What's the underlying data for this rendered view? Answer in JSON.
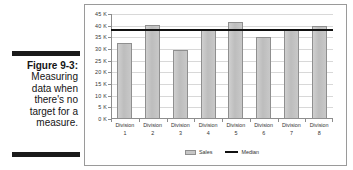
{
  "caption": {
    "figure_number": "Figure 9-3:",
    "lines": [
      "Measuring",
      "data when",
      "there's no",
      "target for a",
      "measure."
    ]
  },
  "chart_data": {
    "type": "bar",
    "title": "",
    "xlabel": "",
    "ylabel": "",
    "ylim": [
      0,
      45000
    ],
    "grid": true,
    "legend_position": "bottom",
    "categories": [
      "Division 1",
      "Division 2",
      "Division 3",
      "Division 4",
      "Division 5",
      "Division 6",
      "Division 7",
      "Division 8"
    ],
    "category_lines": [
      [
        "Division",
        "1"
      ],
      [
        "Division",
        "2"
      ],
      [
        "Division",
        "3"
      ],
      [
        "Division",
        "4"
      ],
      [
        "Division",
        "5"
      ],
      [
        "Division",
        "6"
      ],
      [
        "Division",
        "7"
      ],
      [
        "Division",
        "8"
      ]
    ],
    "series": [
      {
        "name": "Sales",
        "type": "bar",
        "color": "#c2c2c2",
        "values": [
          32500,
          40100,
          29500,
          38000,
          41500,
          35000,
          38000,
          40000
        ]
      },
      {
        "name": "Median",
        "type": "line",
        "color": "#111111",
        "value": 38000,
        "values": [
          38000,
          38000,
          38000,
          38000,
          38000,
          38000,
          38000,
          38000
        ]
      }
    ],
    "ytick_values": [
      45000,
      40000,
      35000,
      30000,
      25000,
      20000,
      15000,
      10000,
      5000,
      0
    ],
    "ytick_labels": [
      "45 K",
      "40 K",
      "35 K",
      "30 K",
      "25 K",
      "20 K",
      "15 K",
      "10 K",
      "5 K",
      "0 K"
    ],
    "legend": [
      {
        "label": "Sales",
        "marker": "bar-swatch"
      },
      {
        "label": "Median",
        "marker": "line-swatch"
      }
    ]
  },
  "colors": {
    "bar_fill": "#c2c2c2",
    "bar_stroke": "#8f8f8f",
    "median_line": "#111111",
    "grid": "#d8d8d8",
    "axis": "#8d8d8d",
    "frame": "#9a9a9a",
    "caption_rule": "#1a1a1a"
  }
}
